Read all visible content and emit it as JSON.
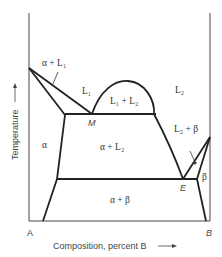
{
  "diagram": {
    "type": "binary monotectic phase diagram",
    "axes": {
      "ylabel": "Temperature",
      "xlabel": "Composition, percent B",
      "left_end": "A",
      "right_end": "B"
    },
    "regions": {
      "alpha_plus_L1": "α + L₁",
      "L1": "L₁",
      "L1_plus_L2": "L₁ + L₂",
      "L2": "L₂",
      "alpha": "α",
      "alpha_plus_L2": "α + L₂",
      "L2_plus_beta": "L₂ + β",
      "beta": "β",
      "alpha_plus_beta": "α + β"
    },
    "points": {
      "monotectic": "M",
      "eutectic": "E"
    }
  }
}
